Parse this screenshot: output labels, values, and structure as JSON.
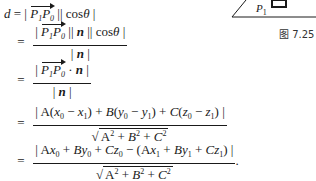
{
  "figure": {
    "label_p1": "P",
    "label_p1_sub": "1",
    "caption": "图 7.25"
  },
  "lines": [
    {
      "lhs": "d",
      "eq": "=",
      "text": "| P₁P₀ | | cosθ |"
    },
    {
      "eq": "=",
      "numerator": "| P₁P₀ | | n | | cosθ |",
      "denominator": "| n |"
    },
    {
      "eq": "=",
      "numerator": "| P₁P₀ · n |",
      "denominator": "| n |"
    },
    {
      "eq": "=",
      "numerator": "| A(x₀ − x₁) + B(y₀ − y₁) + C(z₀ − z₁) |",
      "denominator": "√(A² + B² + C²)"
    },
    {
      "eq": "=",
      "numerator": "| Ax₀ + By₀ + Cz₀ − (Ax₁ + By₁ + Cz₁) |",
      "denominator": "√(A² + B² + C²)",
      "trailing": "."
    }
  ],
  "sym": {
    "d": "d",
    "eq": "=",
    "bar": "|",
    "cos": "cos",
    "theta": "θ",
    "n": "n",
    "dot": "·",
    "P": "P",
    "s0": "0",
    "s1": "1",
    "A": "A",
    "B": "B",
    "C": "C",
    "x": "x",
    "y": "y",
    "z": "z",
    "plus": "+",
    "minus": "−",
    "lp": "(",
    "rp": ")",
    "two": "2",
    "radical": "√",
    "period": "."
  }
}
